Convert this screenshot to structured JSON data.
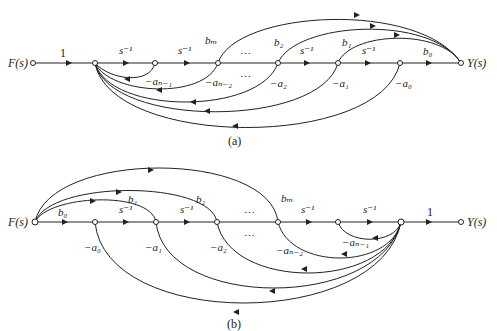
{
  "diagrams": [
    {
      "id": "a",
      "caption": "(a)",
      "input_label": "F(s)",
      "output_label": "Y(s)",
      "forward_gains": [
        "1",
        "s⁻¹",
        "s⁻¹",
        "…",
        "s⁻¹",
        "s⁻¹",
        "b₀"
      ],
      "feedforward_labels": [
        "bₘ",
        "b₂",
        "b₁"
      ],
      "feedback_labels": [
        "−aₙ₋₁",
        "−aₙ₋₂",
        "−a₂",
        "−a₁",
        "−a₀"
      ],
      "ellipsis": "…"
    },
    {
      "id": "b",
      "caption": "(b)",
      "input_label": "F(s)",
      "output_label": "Y(s)",
      "forward_gains": [
        "b₀",
        "s⁻¹",
        "s⁻¹",
        "…",
        "s⁻¹",
        "s⁻¹",
        "1"
      ],
      "feedforward_labels": [
        "b₁",
        "b₂",
        "bₘ"
      ],
      "feedback_labels": [
        "−a₀",
        "−a₁",
        "−a₂",
        "−aₙ₋₂",
        "−aₙ₋₁"
      ],
      "ellipsis": "…"
    }
  ]
}
